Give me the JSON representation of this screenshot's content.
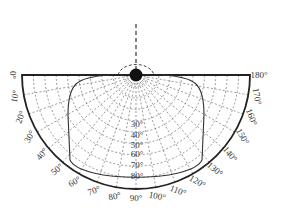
{
  "diagram": {
    "type": "polar-light-distribution",
    "center": [
      136,
      75
    ],
    "outer_radius": 114,
    "colors": {
      "line": "#222222",
      "grid": "#555555",
      "background": "#ffffff"
    },
    "outer_angle_labels": [
      "0°",
      "10°",
      "20°",
      "30°",
      "40°",
      "50°",
      "60°",
      "70°",
      "80°",
      "90°",
      "100°",
      "110°",
      "120°",
      "130°",
      "140°",
      "150°",
      "160°",
      "170°",
      "180°"
    ],
    "inner_ring_labels": [
      "30°",
      "40°",
      "50°",
      "60°",
      "70°",
      "80°"
    ],
    "light_source": "filled-circle",
    "vertical_axis": "dashed"
  }
}
